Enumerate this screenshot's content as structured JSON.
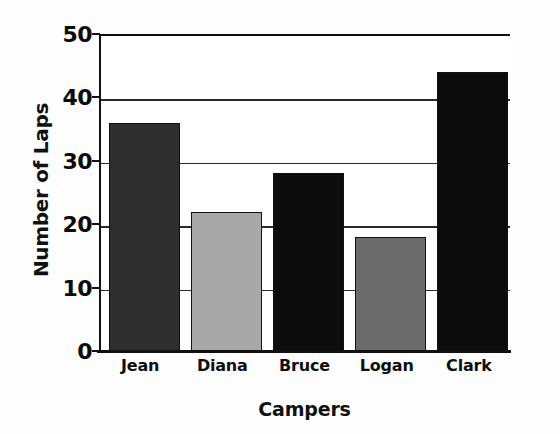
{
  "chart_data": {
    "type": "bar",
    "title": "",
    "xlabel": "Campers",
    "ylabel": "Number of Laps",
    "categories": [
      "Jean",
      "Diana",
      "Bruce",
      "Logan",
      "Clark"
    ],
    "values": [
      36,
      22,
      28,
      18,
      44
    ],
    "ylim": [
      0,
      50
    ],
    "yticks": [
      0,
      10,
      20,
      30,
      40,
      50
    ],
    "ytick_labels": [
      "0",
      "10",
      "20",
      "30",
      "40",
      "50"
    ],
    "grid": true,
    "grid_axis": "y",
    "legend": false,
    "bar_colors": [
      "#2e2e2e",
      "#a8a8a8",
      "#0c0c0c",
      "#6b6b6b",
      "#0c0c0c"
    ],
    "bar_edge_color": "#111111",
    "background_color": "#ffffff",
    "axis_color": "#111111",
    "series": [
      {
        "name": "Number of Laps",
        "values": [
          36,
          22,
          28,
          18,
          44
        ]
      }
    ]
  }
}
